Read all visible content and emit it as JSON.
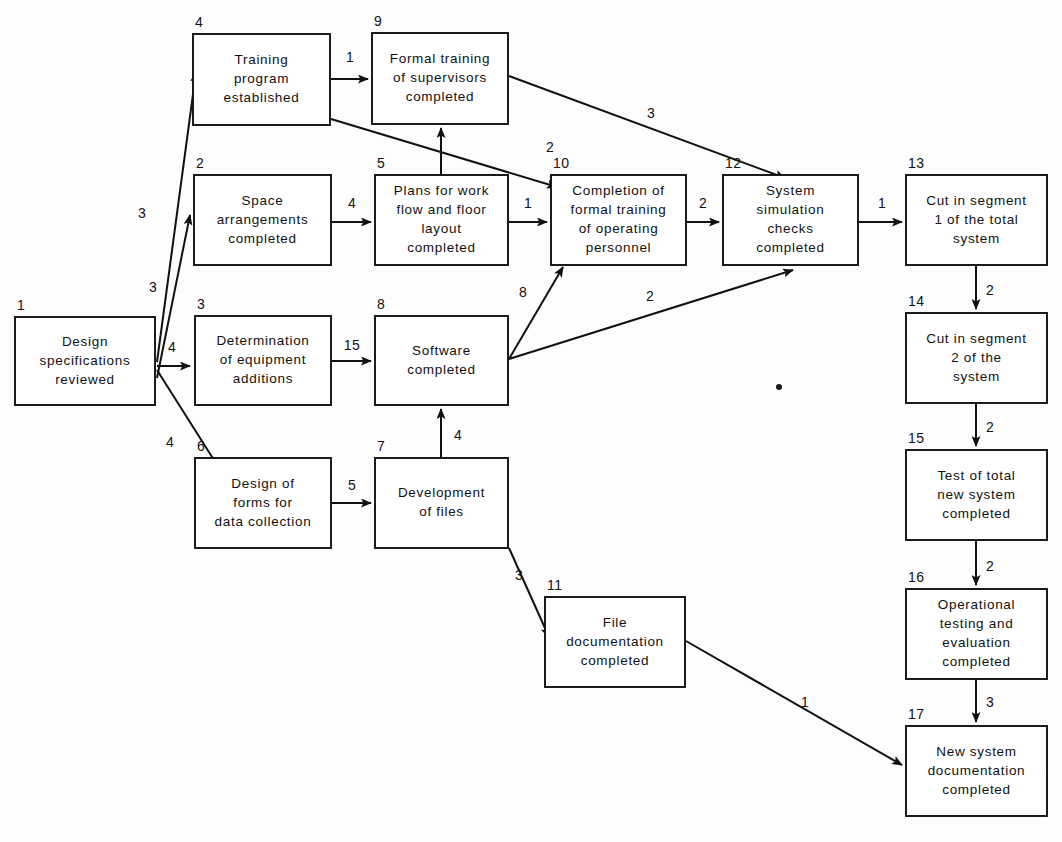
{
  "diagram": {
    "type": "pert-network-diagram",
    "background_color": "#fdfdfd",
    "line_color": "#111111",
    "box_fill": "#ffffff",
    "nodes": [
      {
        "id": "1",
        "number": "1",
        "lines": [
          "Design",
          "specifications",
          "reviewed"
        ],
        "x": 15,
        "y": 317,
        "w": 140,
        "h": 88
      },
      {
        "id": "4",
        "number": "4",
        "lines": [
          "Training",
          "program",
          "established"
        ],
        "x": 193,
        "y": 34,
        "w": 137,
        "h": 91
      },
      {
        "id": "9",
        "number": "9",
        "lines": [
          "Formal training",
          "of supervisors",
          "completed"
        ],
        "x": 372,
        "y": 33,
        "w": 136,
        "h": 91
      },
      {
        "id": "2",
        "number": "2",
        "lines": [
          "Space",
          "arrangements",
          "completed"
        ],
        "x": 194,
        "y": 175,
        "w": 137,
        "h": 90
      },
      {
        "id": "5",
        "number": "5",
        "lines": [
          "Plans for work",
          "flow and floor",
          "layout",
          "completed"
        ],
        "x": 375,
        "y": 175,
        "w": 133,
        "h": 90
      },
      {
        "id": "10",
        "number": "10",
        "lines": [
          "Completion of",
          "formal training",
          "of operating",
          "personnel"
        ],
        "x": 551,
        "y": 175,
        "w": 135,
        "h": 90
      },
      {
        "id": "12",
        "number": "12",
        "lines": [
          "System",
          "simulation",
          "checks",
          "completed"
        ],
        "x": 723,
        "y": 175,
        "w": 135,
        "h": 90
      },
      {
        "id": "13",
        "number": "13",
        "lines": [
          "Cut in segment",
          "1 of the total",
          "system"
        ],
        "x": 906,
        "y": 175,
        "w": 141,
        "h": 90
      },
      {
        "id": "3",
        "number": "3",
        "lines": [
          "Determination",
          "of equipment",
          "additions"
        ],
        "x": 195,
        "y": 316,
        "w": 136,
        "h": 89
      },
      {
        "id": "8",
        "number": "8",
        "lines": [
          "Software",
          "completed"
        ],
        "x": 375,
        "y": 316,
        "w": 133,
        "h": 89
      },
      {
        "id": "14",
        "number": "14",
        "lines": [
          "Cut in segment",
          "2 of the",
          "system"
        ],
        "x": 906,
        "y": 313,
        "w": 141,
        "h": 90
      },
      {
        "id": "6",
        "number": "6",
        "lines": [
          "Design of",
          "forms for",
          "data collection"
        ],
        "x": 195,
        "y": 458,
        "w": 136,
        "h": 90
      },
      {
        "id": "7",
        "number": "7",
        "lines": [
          "Development",
          "of files"
        ],
        "x": 375,
        "y": 458,
        "w": 133,
        "h": 90
      },
      {
        "id": "15",
        "number": "15",
        "lines": [
          "Test of total",
          "new system",
          "completed"
        ],
        "x": 906,
        "y": 450,
        "w": 141,
        "h": 90
      },
      {
        "id": "11",
        "number": "11",
        "lines": [
          "File",
          "documentation",
          "completed"
        ],
        "x": 545,
        "y": 597,
        "w": 140,
        "h": 90
      },
      {
        "id": "16",
        "number": "16",
        "lines": [
          "Operational",
          "testing and",
          "evaluation",
          "completed"
        ],
        "x": 906,
        "y": 589,
        "w": 141,
        "h": 90
      },
      {
        "id": "17",
        "number": "17",
        "lines": [
          "New system",
          "documentation",
          "completed"
        ],
        "x": 906,
        "y": 726,
        "w": 141,
        "h": 90
      }
    ],
    "edges": [
      {
        "from": "1",
        "to": "4",
        "label": "3",
        "label_x": 142,
        "label_y": 218,
        "path": "M157,362 L196,72",
        "arrow": "up-right"
      },
      {
        "from": "1",
        "to": "2",
        "label": "3",
        "label_x": 153,
        "label_y": 292,
        "path": "M157,378 L190,215",
        "arrow": "up-right"
      },
      {
        "from": "1",
        "to": "3",
        "label": "4",
        "label_x": 172,
        "label_y": 352,
        "path": "M157,366 L190,366",
        "arrow": "right"
      },
      {
        "from": "1",
        "to": "6",
        "label": "4",
        "label_x": 170,
        "label_y": 447,
        "path": "M157,370 L219,468",
        "arrow": "down-right"
      },
      {
        "from": "4",
        "to": "9",
        "label": "1",
        "label_x": 350,
        "label_y": 62,
        "path": "M331,79 L368,79",
        "arrow": "right"
      },
      {
        "from": "4",
        "to": "10",
        "label": "2",
        "label_x": 550,
        "label_y": 152,
        "path": "M331,119 L557,187",
        "arrow": "down-right"
      },
      {
        "from": "2",
        "to": "5",
        "label": "4",
        "label_x": 352,
        "label_y": 208,
        "path": "M332,222 L371,222",
        "arrow": "right"
      },
      {
        "from": "5",
        "to": "9",
        "label": "",
        "label_x": 0,
        "label_y": 0,
        "path": "M441,175 L441,128",
        "arrow": "up"
      },
      {
        "from": "5",
        "to": "10",
        "label": "1",
        "label_x": 528,
        "label_y": 208,
        "path": "M509,222 L547,222",
        "arrow": "right"
      },
      {
        "from": "9",
        "to": "12",
        "label": "3",
        "label_x": 651,
        "label_y": 118,
        "path": "M509,76 L785,178",
        "arrow": "down-right"
      },
      {
        "from": "10",
        "to": "12",
        "label": "2",
        "label_x": 703,
        "label_y": 208,
        "path": "M687,222 L719,222",
        "arrow": "right"
      },
      {
        "from": "12",
        "to": "13",
        "label": "1",
        "label_x": 882,
        "label_y": 208,
        "path": "M859,222 L902,222",
        "arrow": "right"
      },
      {
        "from": "3",
        "to": "8",
        "label": "15",
        "label_x": 352,
        "label_y": 350,
        "path": "M332,361 L371,361",
        "arrow": "right"
      },
      {
        "from": "8",
        "to": "10",
        "label": "8",
        "label_x": 523,
        "label_y": 297,
        "path": "M509,359 L563,267",
        "arrow": "up-right"
      },
      {
        "from": "8",
        "to": "12",
        "label": "2",
        "label_x": 650,
        "label_y": 301,
        "path": "M509,359 L793,270",
        "arrow": "up-right"
      },
      {
        "from": "6",
        "to": "7",
        "label": "5",
        "label_x": 352,
        "label_y": 490,
        "path": "M332,503 L371,503",
        "arrow": "right"
      },
      {
        "from": "7",
        "to": "8",
        "label": "4",
        "label_x": 458,
        "label_y": 440,
        "path": "M441,458 L441,409",
        "arrow": "up"
      },
      {
        "from": "7",
        "to": "11",
        "label": "3",
        "label_x": 519,
        "label_y": 580,
        "path": "M509,548 L549,637",
        "arrow": "down-right"
      },
      {
        "from": "11",
        "to": "17",
        "label": "1",
        "label_x": 805,
        "label_y": 707,
        "path": "M686,641 L902,765",
        "arrow": "down-right"
      },
      {
        "from": "13",
        "to": "14",
        "label": "2",
        "label_x": 990,
        "label_y": 295,
        "path": "M976,265 L976,309",
        "arrow": "down"
      },
      {
        "from": "14",
        "to": "15",
        "label": "2",
        "label_x": 990,
        "label_y": 432,
        "path": "M976,403 L976,446",
        "arrow": "down"
      },
      {
        "from": "15",
        "to": "16",
        "label": "2",
        "label_x": 990,
        "label_y": 571,
        "path": "M976,540 L976,585",
        "arrow": "down"
      },
      {
        "from": "16",
        "to": "17",
        "label": "3",
        "label_x": 990,
        "label_y": 707,
        "path": "M976,679 L976,722",
        "arrow": "down"
      }
    ],
    "marks": [
      {
        "name": "ink-speck",
        "x": 779,
        "y": 387,
        "r": 3
      }
    ]
  }
}
